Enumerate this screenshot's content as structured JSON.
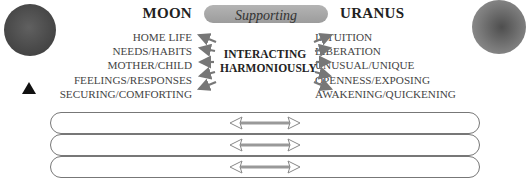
{
  "left_planet": {
    "name": "MOON",
    "icon": "moon-sphere",
    "marker": "triangle-up",
    "keywords": [
      "HOME LIFE",
      "NEEDS/HABITS",
      "MOTHER/CHILD",
      "FEELINGS/RESPONSES",
      "SECURING/COMFORTING"
    ]
  },
  "right_planet": {
    "name": "URANUS",
    "icon": "uranus-sphere",
    "keywords": [
      "INTUITION",
      "LIBERATION",
      "UNUSUAL/UNIQUE",
      "OPENNESS/EXPOSING",
      "AWAKENING/QUICKENING"
    ]
  },
  "aspect": {
    "label": "Supporting",
    "center_line1": "INTERACTING",
    "center_line2": "HARMONIOUSLY"
  },
  "rows": [
    {
      "icon": "double-arrow"
    },
    {
      "icon": "double-arrow"
    },
    {
      "icon": "double-arrow"
    }
  ],
  "colors": {
    "pill": "#a8a8a8",
    "arrow": "#777777",
    "bar_border": "#777777",
    "text": "#444444"
  }
}
